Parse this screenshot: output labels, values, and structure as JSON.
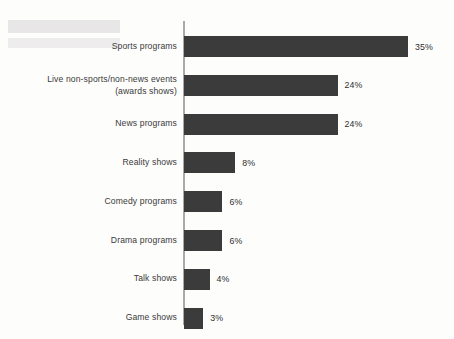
{
  "chart_data": {
    "type": "bar",
    "orientation": "horizontal",
    "title": "",
    "xlabel": "",
    "ylabel": "",
    "grid": false,
    "legend": false,
    "axis": {
      "visible": true,
      "position": "left",
      "color": "#a9a9a9"
    },
    "value_suffix": "%",
    "xlim": [
      0,
      35
    ],
    "categories": [
      "Sports programs",
      "Live non-sports/non-news events\n(awards shows)",
      "News programs",
      "Reality shows",
      "Comedy programs",
      "Drama programs",
      "Talk shows",
      "Game shows"
    ],
    "values": [
      35,
      24,
      24,
      8,
      6,
      6,
      4,
      3
    ],
    "value_labels": [
      "35%",
      "24%",
      "24%",
      "8%",
      "6%",
      "6%",
      "4%",
      "3%"
    ],
    "bar_color": "#3b3b3b",
    "background_color": "#fdfdfc",
    "text_color": "#3a3a3a"
  },
  "bars": [
    {
      "label": "Sports programs",
      "value": 35,
      "value_label": "35%"
    },
    {
      "label": "Live non-sports/non-news events\n(awards shows)",
      "value": 24,
      "value_label": "24%"
    },
    {
      "label": "News programs",
      "value": 24,
      "value_label": "24%"
    },
    {
      "label": "Reality shows",
      "value": 8,
      "value_label": "8%"
    },
    {
      "label": "Comedy programs",
      "value": 6,
      "value_label": "6%"
    },
    {
      "label": "Drama programs",
      "value": 6,
      "value_label": "6%"
    },
    {
      "label": "Talk shows",
      "value": 4,
      "value_label": "4%"
    },
    {
      "label": "Game shows",
      "value": 3,
      "value_label": "3%"
    }
  ]
}
